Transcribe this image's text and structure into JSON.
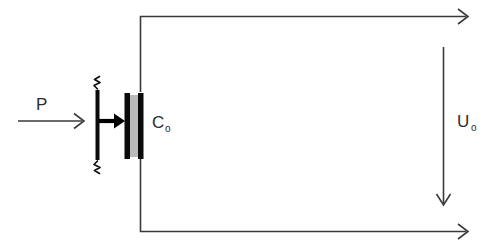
{
  "figure": {
    "background_color": "#ffffff",
    "width": 488,
    "height": 247
  },
  "labels": {
    "pressure": "P",
    "capacitance": "C",
    "capacitance_subscript": "o",
    "voltage": "U",
    "voltage_subscript": "o"
  },
  "colors": {
    "wire": "#3a3a3a",
    "plate": "#0a0a0a",
    "dielectric": "#b9b9b9",
    "text": "#2b2b2b"
  },
  "elements": {
    "pressure_arrow": "arrow-right",
    "force_arrow": "arrow-right-bold",
    "voltage_arrow": "arrow-down",
    "top_terminal_arrow": "arrow-right",
    "bottom_terminal_arrow": "arrow-right",
    "spring_top": "spring-zigzag",
    "spring_bottom": "spring-zigzag",
    "capacitor": "parallel-plate-capacitor",
    "diaphragm": "movable-membrane-bar"
  }
}
